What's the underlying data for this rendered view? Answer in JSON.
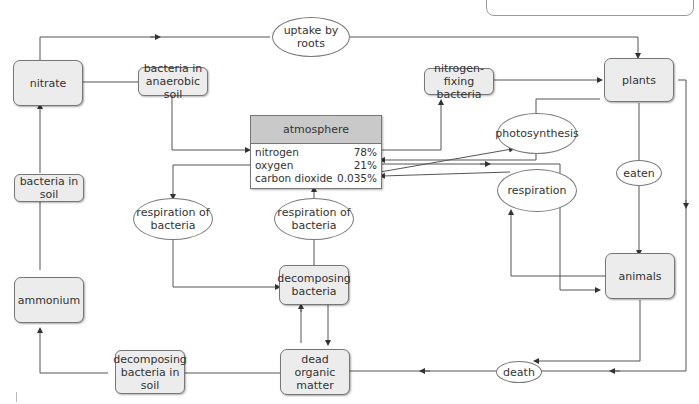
{
  "diagram": {
    "type": "nitrogen and carbon cycle flow diagram",
    "nodes": {
      "nitrate": "nitrate",
      "bacteria_anaerobic": "bacteria in anaerobic soil",
      "uptake_by_roots": "uptake by roots",
      "nitrogen_fixing": "nitrogen-fixing bacteria",
      "plants": "plants",
      "photosynthesis": "photosynthesis",
      "respiration": "respiration",
      "eaten": "eaten",
      "animals": "animals",
      "death": "death",
      "bacteria_in_soil": "bacteria in soil",
      "ammonium": "ammonium",
      "respiration_of_bacteria_left": "respiration of bacteria",
      "respiration_of_bacteria_right": "respiration of bacteria",
      "decomposing_bacteria": "decomposing bacteria",
      "dead_organic_matter": "dead organic matter",
      "decomposing_bacteria_soil": "decomposing bacteria in soil"
    },
    "atmosphere": {
      "title": "atmosphere",
      "rows": [
        {
          "gas": "nitrogen",
          "percent": "78%"
        },
        {
          "gas": "oxygen",
          "percent": "21%"
        },
        {
          "gas": "carbon dioxide",
          "percent": "0.035%"
        }
      ]
    },
    "edges": [
      {
        "from": "nitrate",
        "to": "plants",
        "via": "uptake by roots"
      },
      {
        "from": "nitrate",
        "to": "atmosphere.nitrogen",
        "via": "bacteria in anaerobic soil"
      },
      {
        "from": "atmosphere.nitrogen",
        "to": "plants",
        "via": "nitrogen-fixing bacteria"
      },
      {
        "from": "atmosphere.carbon dioxide",
        "to": "plants",
        "via": "photosynthesis"
      },
      {
        "from": "photosynthesis",
        "to": "atmosphere.oxygen"
      },
      {
        "from": "atmosphere.oxygen",
        "to": "animals",
        "via": "respiration"
      },
      {
        "from": "animals",
        "to": "atmosphere.carbon dioxide",
        "via": "respiration"
      },
      {
        "from": "plants",
        "to": "animals",
        "via": "eaten"
      },
      {
        "from": "plants",
        "to": "dead organic matter",
        "via": "death"
      },
      {
        "from": "animals",
        "to": "dead organic matter",
        "via": "death"
      },
      {
        "from": "atmosphere.oxygen",
        "to": "decomposing bacteria",
        "via": "respiration of bacteria"
      },
      {
        "from": "decomposing bacteria",
        "to": "atmosphere.carbon dioxide",
        "via": "respiration of bacteria"
      },
      {
        "from": "dead organic matter",
        "to": "decomposing bacteria"
      },
      {
        "from": "decomposing bacteria",
        "to": "dead organic matter"
      },
      {
        "from": "dead organic matter",
        "to": "ammonium",
        "via": "decomposing bacteria in soil"
      },
      {
        "from": "ammonium",
        "to": "nitrate",
        "via": "bacteria in soil"
      }
    ]
  },
  "colors": {
    "box_fill": "#ececec",
    "header_fill": "#c9c9c9",
    "line": "#555555"
  }
}
